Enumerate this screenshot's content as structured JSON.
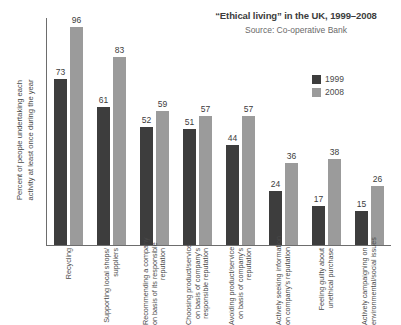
{
  "chart_data": {
    "type": "bar",
    "title": "“Ethical living” in the UK, 1999–2008",
    "subtitle": "Source: Co-operative Bank",
    "xlabel": "",
    "ylabel": "Percent of people undertaking each activity at least once during the year",
    "ylim": [
      0,
      100
    ],
    "grid": false,
    "legend_position": "top-right",
    "categories": [
      "Recycling",
      "Supporting local shops/ suppliers",
      "Recommending a company on basis of its responsible reputation",
      "Choosing product/service on basis of company's responsible reputation",
      "Avoiding product/service on basis of company's reputation",
      "Actively seeking information on company's reputation",
      "Feeling guilty about unethical purchase",
      "Actively campaigning on environmental/social issues"
    ],
    "series": [
      {
        "name": "1999",
        "color": "#3d3d3d",
        "values": [
          73,
          61,
          52,
          51,
          44,
          24,
          17,
          15
        ]
      },
      {
        "name": "2008",
        "color": "#9b9b9b",
        "values": [
          96,
          83,
          59,
          57,
          57,
          36,
          38,
          26
        ]
      }
    ]
  },
  "header": {
    "title": "“Ethical living” in the UK, 1999–2008",
    "source": "Source: Co-operative Bank"
  },
  "axis": {
    "y_title_line1": "Percent of people undertaking each",
    "y_title_line2": "activity at least once during the year"
  },
  "legend": {
    "items": [
      {
        "label": "1999",
        "color": "#3d3d3d"
      },
      {
        "label": "2008",
        "color": "#9b9b9b"
      }
    ]
  },
  "categories_wrapped": [
    [
      "Recycling"
    ],
    [
      "Supporting local shops/",
      "suppliers"
    ],
    [
      "Recommending a company",
      "on basis of its responsible",
      "reputation"
    ],
    [
      "Choosing product/service",
      "on basis of company's",
      "responsible reputation"
    ],
    [
      "Avoiding product/service",
      "on basis of company's",
      "reputation"
    ],
    [
      "Actively seeking information",
      "on company's reputation"
    ],
    [
      "Feeling guilty about",
      "unethical purchase"
    ],
    [
      "Actively campaigning on",
      "environmental/social issues"
    ]
  ]
}
